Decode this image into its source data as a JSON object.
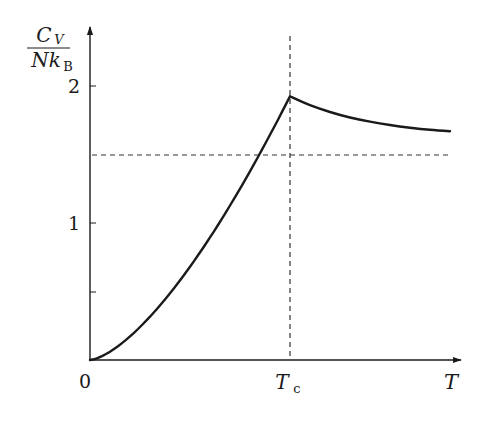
{
  "chart_data": {
    "type": "line",
    "title": "",
    "xlabel": "T",
    "ylabel": "C_V / N k_B",
    "ylabel_parts": {
      "numerator_main": "C",
      "numerator_sub": "V",
      "denominator_main": "Nk",
      "denominator_sub": "B"
    },
    "x_ticks": [
      {
        "value": 0,
        "label": "0"
      },
      {
        "value": 1,
        "label": "T",
        "label_sub": "c"
      }
    ],
    "y_ticks": [
      {
        "value": 0.5,
        "label": ""
      },
      {
        "value": 1,
        "label": "1"
      },
      {
        "value": 2,
        "label": "2"
      }
    ],
    "x_units": "T / T_c",
    "xlim": [
      0,
      1.85
    ],
    "ylim": [
      0,
      2.4
    ],
    "grid": false,
    "legend": null,
    "reference_lines": [
      {
        "orientation": "horizontal",
        "value": 1.5,
        "style": "dashed",
        "meaning": "classical limit 3/2"
      },
      {
        "orientation": "vertical",
        "value": 1.0,
        "style": "dashed",
        "meaning": "T_c"
      }
    ],
    "series": [
      {
        "name": "C_V / N k_B",
        "x": [
          0,
          0.1,
          0.2,
          0.3,
          0.4,
          0.5,
          0.6,
          0.7,
          0.8,
          0.9,
          1.0,
          1.1,
          1.2,
          1.3,
          1.4,
          1.5,
          1.6,
          1.7,
          1.8
        ],
        "values": [
          0,
          0.061,
          0.172,
          0.316,
          0.487,
          0.681,
          0.895,
          1.127,
          1.377,
          1.644,
          1.925,
          1.86,
          1.81,
          1.77,
          1.74,
          1.715,
          1.695,
          1.68,
          1.67
        ]
      }
    ]
  },
  "labels": {
    "origin": "0",
    "tc_main": "T",
    "tc_sub": "c",
    "x_axis": "T",
    "y_tick_1": "1",
    "y_tick_2": "2",
    "y_num_main": "C",
    "y_num_sub": "V",
    "y_den_main": "Nk",
    "y_den_sub": "B"
  }
}
